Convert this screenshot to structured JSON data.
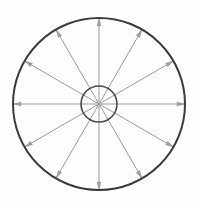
{
  "figure": {
    "background_color": "#fefefe",
    "canvas": {
      "width": 197,
      "height": 209
    }
  },
  "chart_data": {
    "type": "scatter",
    "title": "",
    "subtitle": "",
    "xlabel": "",
    "ylabel": "",
    "grid": false,
    "legend": null,
    "annotations": [],
    "center": {
      "x": 99,
      "y": 104
    },
    "outer_circle": {
      "name": "outer-circle",
      "radius": 86,
      "stroke": "#3b3b3b",
      "stroke_width": 2.0
    },
    "inner_circle": {
      "name": "inner-circle",
      "radius": 18,
      "stroke": "#4a4a4a",
      "stroke_width": 1.6
    },
    "spokes": {
      "count": 12,
      "angle_step_degrees": 30,
      "start_angle_degrees": 270,
      "stroke": "#9b9b9b",
      "stroke_width": 1.0,
      "arrowhead_length": 8,
      "arrowhead_width": 4,
      "angles_degrees": [
        270,
        300,
        330,
        0,
        30,
        60,
        90,
        120,
        150,
        180,
        210,
        240
      ],
      "labels": [
        "spoke-0-up",
        "spoke-1",
        "spoke-2",
        "spoke-3-right",
        "spoke-4",
        "spoke-5",
        "spoke-6-down",
        "spoke-7",
        "spoke-8",
        "spoke-9-left",
        "spoke-10",
        "spoke-11"
      ]
    }
  }
}
